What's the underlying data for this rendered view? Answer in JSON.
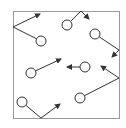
{
  "diagram": {
    "type": "particles-in-box",
    "colors": {
      "background": "#ffffff",
      "box_stroke": "#9a9a9a",
      "particle_stroke": "#333333",
      "path_stroke": "#333333"
    },
    "box": {
      "x1": 13,
      "y1": 11,
      "x2": 119,
      "y2": 118
    },
    "particle_radius": 5,
    "particles": [
      {
        "id": 1,
        "cx": 41,
        "cy": 41,
        "path": [
          [
            41,
            41
          ],
          [
            13,
            27
          ],
          [
            40,
            14
          ]
        ],
        "bounces": "left-wall"
      },
      {
        "id": 2,
        "cx": 67,
        "cy": 25,
        "path": [
          [
            67,
            25
          ],
          [
            81,
            11
          ],
          [
            89,
            19
          ]
        ],
        "bounces": "top-wall"
      },
      {
        "id": 3,
        "cx": 95,
        "cy": 34,
        "path": [
          [
            95,
            34
          ],
          [
            119,
            50
          ],
          [
            112,
            57
          ]
        ],
        "bounces": "right-wall"
      },
      {
        "id": 4,
        "cx": 31,
        "cy": 73,
        "path": [
          [
            31,
            73
          ],
          [
            61,
            59
          ]
        ],
        "bounces": "none"
      },
      {
        "id": 5,
        "cx": 85,
        "cy": 67,
        "path": [
          [
            85,
            67
          ],
          [
            67,
            67
          ]
        ],
        "bounces": "none"
      },
      {
        "id": 6,
        "cx": 80,
        "cy": 98,
        "path": [
          [
            80,
            98
          ],
          [
            119,
            78
          ],
          [
            101,
            66
          ]
        ],
        "bounces": "right-wall"
      },
      {
        "id": 7,
        "cx": 22,
        "cy": 102,
        "path": [
          [
            22,
            102
          ],
          [
            41,
            118
          ],
          [
            60,
            104
          ]
        ],
        "bounces": "bottom-wall"
      }
    ]
  }
}
